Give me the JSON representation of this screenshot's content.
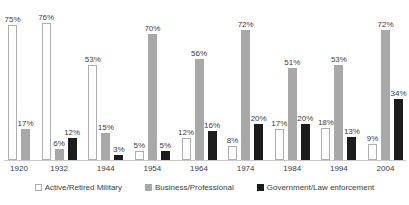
{
  "chart_data": {
    "type": "bar",
    "categories": [
      "1920",
      "1932",
      "1944",
      "1954",
      "1964",
      "1974",
      "1984",
      "1994",
      "2004"
    ],
    "series": [
      {
        "name": "Active/Retired Military",
        "fill": "#ffffff",
        "border": "#adadad",
        "values": [
          75,
          76,
          53,
          5,
          12,
          8,
          17,
          18,
          9
        ]
      },
      {
        "name": "Business/Professional",
        "fill": "#a8a8a8",
        "border": "#a8a8a8",
        "values": [
          17,
          6,
          15,
          70,
          56,
          72,
          51,
          53,
          72
        ]
      },
      {
        "name": "Government/Law enforcement",
        "fill": "#1c1c1c",
        "border": "#1c1c1c",
        "values": [
          null,
          12,
          3,
          5,
          16,
          20,
          20,
          13,
          34
        ]
      }
    ],
    "value_suffix": "%",
    "title": "",
    "xlabel": "",
    "ylabel": "",
    "ylim": [
      0,
      80
    ],
    "grid": false,
    "legend_position": "bottom",
    "text_color": "#3d3d3d",
    "axis_line_color": "#c9c9c9",
    "background": "#ffffff"
  }
}
